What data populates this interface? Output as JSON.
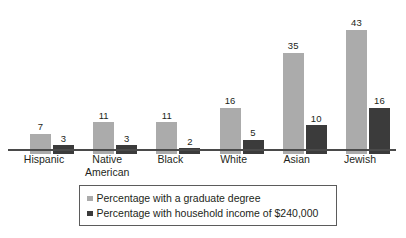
{
  "chart_data": {
    "type": "bar",
    "title": "",
    "subtitle": "",
    "xlabel": "",
    "ylabel": "",
    "ylim": [
      0,
      46
    ],
    "grid": false,
    "legend_position": "bottom",
    "categories": [
      "Hispanic",
      "Native American",
      "Black",
      "White",
      "Asian",
      "Jewish"
    ],
    "series": [
      {
        "name": "Percentage with a graduate degree",
        "color": "#ababab",
        "values": [
          7,
          11,
          11,
          16,
          35,
          43
        ]
      },
      {
        "name": "Percentage with household income of $240,000",
        "color": "#3b3b3b",
        "values": [
          3,
          3,
          2,
          5,
          10,
          16
        ]
      }
    ]
  },
  "axis": {
    "baseline_color": "#4a4a4a"
  },
  "legend": {
    "items": [
      {
        "label": "Percentage with a graduate degree",
        "color": "#ababab"
      },
      {
        "label": "Percentage with household income of $240,000",
        "color": "#3b3b3b"
      }
    ]
  }
}
